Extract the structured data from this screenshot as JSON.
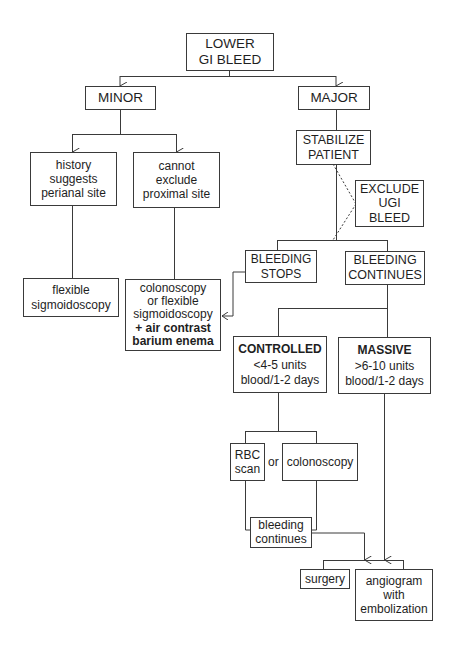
{
  "diagram": {
    "type": "flowchart",
    "root": {
      "lines": [
        "LOWER",
        "GI BLEED"
      ]
    },
    "minor": {
      "label": "MINOR",
      "history": {
        "lines": [
          "history",
          "suggests",
          "perianal site"
        ]
      },
      "cannot_exclude": {
        "lines": [
          "cannot",
          "exclude",
          "proximal site"
        ]
      },
      "flex_sig": {
        "lines": [
          "flexible",
          "sigmoidoscopy"
        ]
      },
      "colonoscopy_combo": {
        "lines": [
          "colonoscopy",
          "or flexible",
          "sigmoidoscopy",
          "+ air contrast",
          "barium enema"
        ]
      }
    },
    "major": {
      "label": "MAJOR",
      "stabilize": {
        "lines": [
          "STABILIZE",
          "PATIENT"
        ]
      },
      "exclude_ugi": {
        "lines": [
          "EXCLUDE",
          "UGI",
          "BLEED"
        ]
      },
      "bleeding_stops": {
        "lines": [
          "BLEEDING",
          "STOPS"
        ]
      },
      "bleeding_continues": {
        "lines": [
          "BLEEDING",
          "CONTINUES"
        ]
      },
      "controlled": {
        "title": "CONTROLLED",
        "lines": [
          "<4-5 units",
          "blood/1-2 days"
        ]
      },
      "massive": {
        "title": "MASSIVE",
        "lines": [
          ">6-10 units",
          "blood/1-2 days"
        ]
      },
      "rbc_scan": {
        "lines": [
          "RBC",
          "scan"
        ]
      },
      "or_label": "or",
      "colonoscopy": {
        "lines": [
          "colonoscopy"
        ]
      },
      "bleeding_continues_2": {
        "lines": [
          "bleeding",
          "continues"
        ]
      },
      "surgery": {
        "lines": [
          "surgery"
        ]
      },
      "angiogram": {
        "lines": [
          "angiogram",
          "with",
          "embolization"
        ]
      }
    },
    "colors": {
      "stroke": "#3a3a3a",
      "text": "#1e1e1e",
      "background": "#ffffff"
    }
  }
}
